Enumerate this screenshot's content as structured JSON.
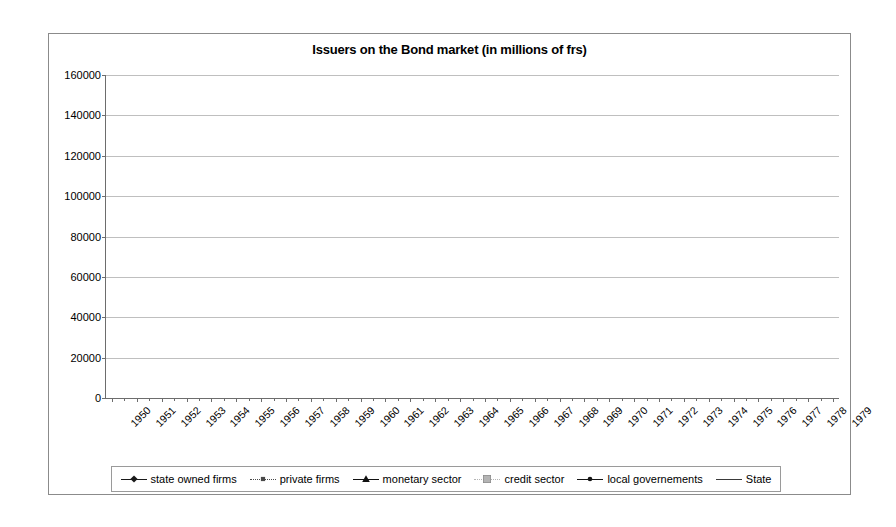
{
  "chart_data": {
    "type": "line",
    "title": "Issuers on the Bond market (in millions of frs)",
    "xlabel": "",
    "ylabel": "",
    "ylim": [
      0,
      160000
    ],
    "ytick_step": 20000,
    "yticks": [
      "0",
      "20000",
      "40000",
      "60000",
      "80000",
      "100000",
      "120000",
      "140000",
      "160000"
    ],
    "grid": true,
    "legend_position": "bottom",
    "categories": [
      "1950",
      "1951",
      "1952",
      "1953",
      "1954",
      "1955",
      "1956",
      "1957",
      "1958",
      "1959",
      "1960",
      "1961",
      "1962",
      "1963",
      "1964",
      "1965",
      "1966",
      "1967",
      "1968",
      "1969",
      "1970",
      "1971",
      "1972",
      "1973",
      "1974",
      "1975",
      "1976",
      "1977",
      "1978",
      "1979"
    ],
    "series": [
      {
        "name": "state owned firms",
        "marker": "diamond",
        "color": "#1a1a1a",
        "values": [
          900,
          1000,
          1200,
          1400,
          1700,
          2300,
          3400,
          4500,
          5600,
          7200,
          8600,
          10500,
          11200,
          11800,
          13200,
          15000,
          17500,
          20500,
          23500,
          25500,
          27500,
          28500,
          30500,
          33000,
          36000,
          38500,
          44000,
          50000,
          58000,
          65500
        ]
      },
      {
        "name": "private firms",
        "marker": "small-square",
        "color": "#4a4a4a",
        "values": [
          800,
          900,
          1100,
          1300,
          1600,
          2100,
          3000,
          4300,
          5800,
          7500,
          8000,
          9500,
          11000,
          11500,
          13000,
          14500,
          17500,
          22500,
          24000,
          25000,
          26500,
          27000,
          27000,
          26500,
          26000,
          26500,
          28000,
          30000,
          33500,
          37500
        ]
      },
      {
        "name": "monetary sector",
        "marker": "triangle",
        "color": "#111111",
        "values": [
          300,
          350,
          420,
          500,
          600,
          800,
          1200,
          1800,
          2400,
          3100,
          3600,
          4200,
          4800,
          5600,
          6500,
          7800,
          9500,
          11500,
          13000,
          14500,
          16500,
          19000,
          22500,
          26500,
          31500,
          38000,
          45000,
          54000,
          62000,
          82000
        ]
      },
      {
        "name": "credit sector",
        "marker": "grey-square",
        "color": "#b4b4b4",
        "values": [
          1200,
          1400,
          1700,
          2100,
          2600,
          3400,
          4600,
          6200,
          7600,
          8800,
          9500,
          11000,
          12500,
          13500,
          15500,
          19000,
          22000,
          25500,
          29500,
          34000,
          40500,
          48500,
          58000,
          69500,
          78000,
          84000,
          93000,
          106500,
          119000,
          143000
        ]
      },
      {
        "name": "local governements",
        "marker": "dot",
        "color": "#151515",
        "values": [
          700,
          750,
          800,
          850,
          900,
          1000,
          1200,
          1500,
          1800,
          2100,
          2400,
          2700,
          3000,
          3300,
          3700,
          4200,
          4800,
          5600,
          6400,
          7200,
          7800,
          8200,
          8500,
          8800,
          9200,
          10000,
          11500,
          13500,
          17000,
          20500
        ]
      },
      {
        "name": "State",
        "marker": "none",
        "color": "#3a3a3a",
        "values": [
          4200,
          4300,
          4500,
          4800,
          5600,
          6800,
          7600,
          7800,
          7900,
          8500,
          11200,
          13500,
          12000,
          11000,
          10500,
          10200,
          11500,
          13500,
          12000,
          11000,
          10200,
          10500,
          11800,
          12500,
          13000,
          16500,
          25500,
          34500,
          41500,
          47500
        ]
      }
    ]
  },
  "legend": {
    "items": [
      {
        "label": "state owned firms",
        "marker": "diamond"
      },
      {
        "label": "private firms",
        "marker": "small-square"
      },
      {
        "label": "monetary sector",
        "marker": "triangle"
      },
      {
        "label": "credit sector",
        "marker": "grey-square"
      },
      {
        "label": "local governements",
        "marker": "dot"
      },
      {
        "label": "State",
        "marker": "none"
      }
    ]
  }
}
